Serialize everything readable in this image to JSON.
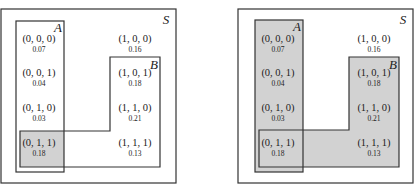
{
  "colors": {
    "border": "#333333",
    "shade": "#d2d2d2",
    "text": "#222222"
  },
  "panels": [
    {
      "name": "left",
      "universe_label": "S",
      "set_a_label": "A",
      "set_b_label": "B",
      "shading": "A ∩ B",
      "cells": [
        {
          "tuple": "(0, 0, 0)",
          "prob": "0.07"
        },
        {
          "tuple": "(0, 0, 1)",
          "prob": "0.04"
        },
        {
          "tuple": "(0, 1, 0)",
          "prob": "0.03"
        },
        {
          "tuple": "(0, 1, 1)",
          "prob": "0.18"
        },
        {
          "tuple": "(1, 0, 0)",
          "prob": "0.16"
        },
        {
          "tuple": "(1, 0, 1)",
          "prob": "0.18"
        },
        {
          "tuple": "(1, 1, 0)",
          "prob": "0.21"
        },
        {
          "tuple": "(1, 1, 1)",
          "prob": "0.13"
        }
      ]
    },
    {
      "name": "right",
      "universe_label": "S",
      "set_a_label": "A",
      "set_b_label": "B",
      "shading": "A ∪ B",
      "cells": [
        {
          "tuple": "(0, 0, 0)",
          "prob": "0.07"
        },
        {
          "tuple": "(0, 0, 1)",
          "prob": "0.04"
        },
        {
          "tuple": "(0, 1, 0)",
          "prob": "0.03"
        },
        {
          "tuple": "(0, 1, 1)",
          "prob": "0.18"
        },
        {
          "tuple": "(1, 0, 0)",
          "prob": "0.16"
        },
        {
          "tuple": "(1, 0, 1)",
          "prob": "0.18"
        },
        {
          "tuple": "(1, 1, 0)",
          "prob": "0.21"
        },
        {
          "tuple": "(1, 1, 1)",
          "prob": "0.13"
        }
      ]
    }
  ]
}
